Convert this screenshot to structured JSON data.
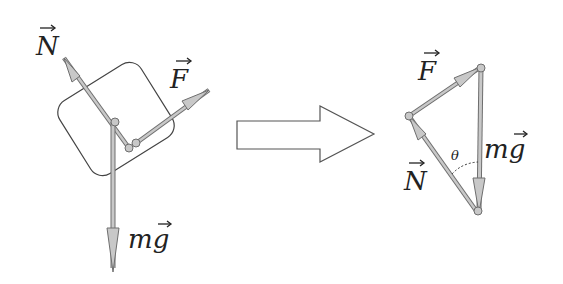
{
  "figure": {
    "left_panel": {
      "title": "Forces on block",
      "labels": {
        "normal": "N",
        "applied": "F",
        "weight": "mg"
      }
    },
    "arrow": {
      "direction": "right"
    },
    "right_panel": {
      "title": "Force triangle",
      "labels": {
        "normal": "N",
        "applied": "F",
        "weight": "mg",
        "angle": "θ"
      }
    },
    "colors": {
      "vector_fill": "#c8c8c8",
      "vector_stroke": "#6e6e6e",
      "outline": "#444444"
    }
  }
}
